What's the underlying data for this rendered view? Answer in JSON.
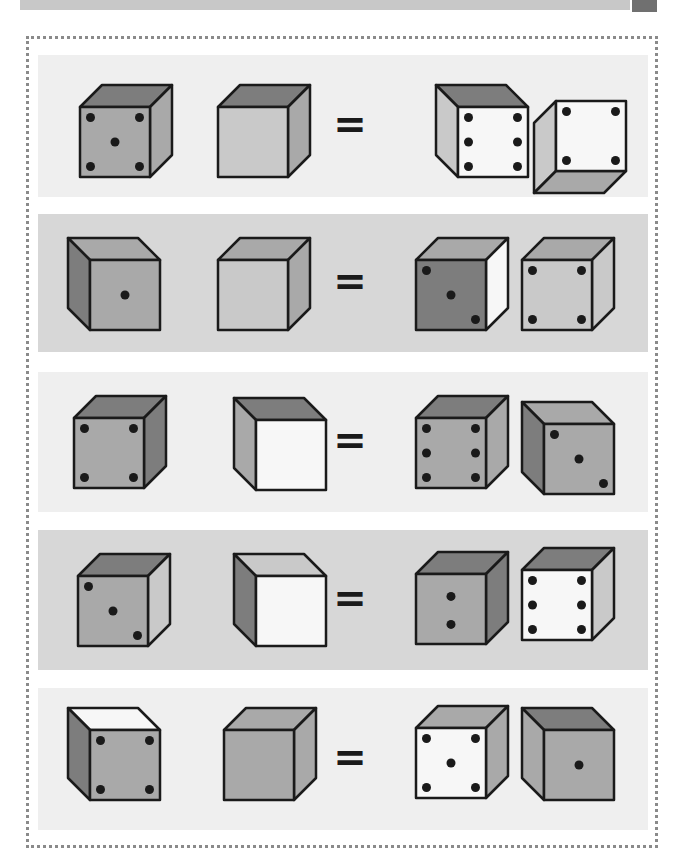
{
  "colors": {
    "panel_light": "#efefef",
    "panel_dark": "#d7d7d7",
    "white": "#f7f7f7",
    "light": "#c9c9c9",
    "mid": "#a9a9a9",
    "dark": "#7d7d7d",
    "outline": "#1a1a1a",
    "pip": "#1a1a1a",
    "equals": "#1a1a1a",
    "header_bar": "#c8c8c8",
    "header_tab": "#707070"
  },
  "equals_symbol": "=",
  "rows": [
    {
      "panel": "panel_light",
      "top": 55,
      "height": 142,
      "cubes": [
        {
          "x": 42,
          "y": 30,
          "view": "right",
          "front": "mid",
          "top": "dark",
          "side": "mid",
          "pips": 5,
          "pip_layout": "five"
        },
        {
          "x": 180,
          "y": 30,
          "view": "right",
          "front": "light",
          "top": "dark",
          "side": "mid",
          "pips": 0,
          "pip_layout": "none"
        },
        {
          "x": 398,
          "y": 30,
          "view": "left",
          "front": "white",
          "top": "dark",
          "side": "light",
          "pips": 6,
          "pip_layout": "six-v"
        },
        {
          "x": 496,
          "y": 46,
          "view": "left-bottom",
          "front": "white",
          "top": "mid",
          "side": "light",
          "pips": 4,
          "pip_layout": "four"
        }
      ]
    },
    {
      "panel": "panel_dark",
      "top": 214,
      "height": 138,
      "cubes": [
        {
          "x": 30,
          "y": 24,
          "view": "left",
          "front": "mid",
          "top": "mid",
          "side": "dark",
          "pips": 1,
          "pip_layout": "one"
        },
        {
          "x": 180,
          "y": 24,
          "view": "right",
          "front": "light",
          "top": "mid",
          "side": "mid",
          "pips": 0,
          "pip_layout": "none"
        },
        {
          "x": 378,
          "y": 24,
          "view": "right",
          "front": "dark",
          "top": "mid",
          "side": "white",
          "pips": 3,
          "pip_layout": "three"
        },
        {
          "x": 484,
          "y": 24,
          "view": "right",
          "front": "light",
          "top": "mid",
          "side": "light",
          "pips": 4,
          "pip_layout": "four"
        }
      ]
    },
    {
      "panel": "panel_light",
      "top": 372,
      "height": 140,
      "cubes": [
        {
          "x": 36,
          "y": 24,
          "view": "right",
          "front": "mid",
          "top": "dark",
          "side": "dark",
          "pips": 4,
          "pip_layout": "four"
        },
        {
          "x": 196,
          "y": 26,
          "view": "left",
          "front": "white",
          "top": "dark",
          "side": "mid",
          "pips": 0,
          "pip_layout": "none"
        },
        {
          "x": 378,
          "y": 24,
          "view": "right",
          "front": "mid",
          "top": "dark",
          "side": "mid",
          "pips": 6,
          "pip_layout": "six-v"
        },
        {
          "x": 484,
          "y": 30,
          "view": "left",
          "front": "mid",
          "top": "mid",
          "side": "dark",
          "pips": 3,
          "pip_layout": "three"
        }
      ]
    },
    {
      "panel": "panel_dark",
      "top": 530,
      "height": 140,
      "cubes": [
        {
          "x": 40,
          "y": 24,
          "view": "right",
          "front": "mid",
          "top": "dark",
          "side": "light",
          "pips": 3,
          "pip_layout": "three"
        },
        {
          "x": 196,
          "y": 24,
          "view": "left",
          "front": "white",
          "top": "light",
          "side": "dark",
          "pips": 0,
          "pip_layout": "none"
        },
        {
          "x": 378,
          "y": 22,
          "view": "right",
          "front": "mid",
          "top": "dark",
          "side": "dark",
          "pips": 2,
          "pip_layout": "two-v"
        },
        {
          "x": 484,
          "y": 18,
          "view": "right",
          "front": "white",
          "top": "dark",
          "side": "light",
          "pips": 6,
          "pip_layout": "six-v"
        }
      ]
    },
    {
      "panel": "panel_light",
      "top": 688,
      "height": 142,
      "cubes": [
        {
          "x": 30,
          "y": 20,
          "view": "left",
          "front": "mid",
          "top": "white",
          "side": "dark",
          "pips": 4,
          "pip_layout": "four"
        },
        {
          "x": 186,
          "y": 20,
          "view": "right",
          "front": "mid",
          "top": "mid",
          "side": "mid",
          "pips": 0,
          "pip_layout": "none"
        },
        {
          "x": 378,
          "y": 18,
          "view": "right",
          "front": "white",
          "top": "mid",
          "side": "mid",
          "pips": 5,
          "pip_layout": "five"
        },
        {
          "x": 484,
          "y": 20,
          "view": "left",
          "front": "mid",
          "top": "dark",
          "side": "mid",
          "pips": 1,
          "pip_layout": "one"
        }
      ]
    }
  ]
}
